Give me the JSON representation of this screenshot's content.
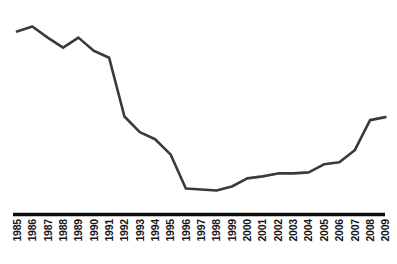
{
  "chart": {
    "title": "",
    "subtitle": "",
    "background_color": "#ffffff",
    "line_color": "#3a3a3a",
    "axis_color": "#0d0d0d",
    "tick_label_color": "#141414",
    "tick_label_rotation": "-90"
  },
  "chart_data": {
    "type": "line",
    "title": "",
    "xlabel": "",
    "ylabel": "",
    "grid": false,
    "legend": false,
    "legend_position": "none",
    "y_axis_visible": false,
    "x_axis_visible": true,
    "xlim": [
      1985,
      2009
    ],
    "ylim": [
      0,
      100
    ],
    "categories": [
      "1985",
      "1986",
      "1987",
      "1988",
      "1989",
      "1990",
      "1991",
      "1992",
      "1993",
      "1994",
      "1995",
      "1996",
      "1997",
      "1998",
      "1999",
      "2000",
      "2001",
      "2002",
      "2003",
      "2004",
      "2005",
      "2006",
      "2007",
      "2008",
      "2009"
    ],
    "x": [
      1985,
      1986,
      1987,
      1988,
      1989,
      1990,
      1991,
      1992,
      1993,
      1994,
      1995,
      1996,
      1997,
      1998,
      1999,
      2000,
      2001,
      2002,
      2003,
      2004,
      2005,
      2006,
      2007,
      2008,
      2009
    ],
    "values": [
      96.4,
      99.4,
      92.7,
      86.7,
      92.7,
      84.8,
      80.6,
      45.2,
      35.8,
      31.5,
      22.4,
      1.8,
      1.2,
      0.6,
      3.0,
      7.9,
      9.1,
      10.9,
      10.9,
      11.5,
      16.4,
      17.6,
      24.8,
      43.0,
      44.8
    ],
    "series": [
      {
        "name": "series-1",
        "color": "#3a3a3a",
        "values": [
          96.4,
          99.4,
          92.7,
          86.7,
          92.7,
          84.8,
          80.6,
          45.2,
          35.8,
          31.5,
          22.4,
          1.8,
          1.2,
          0.6,
          3.0,
          7.9,
          9.1,
          10.9,
          10.9,
          11.5,
          16.4,
          17.6,
          24.8,
          43.0,
          44.8
        ]
      }
    ],
    "annotations": []
  },
  "axis": {
    "baseline_label": "x-axis-baseline"
  }
}
